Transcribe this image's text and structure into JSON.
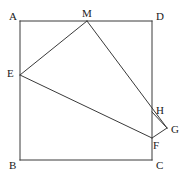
{
  "figure": {
    "kind": "plane-geometry-diagram",
    "width": 188,
    "height": 182,
    "background_color": "#ffffff",
    "stroke_color": "#3a3a3a",
    "label_color": "#1a1a1a",
    "stroke_width": 1
  },
  "vertices": {
    "A": {
      "label": "A",
      "x": 20,
      "y": 21,
      "label_x": 9,
      "label_y": 11,
      "on": "square-corner-top-left"
    },
    "D": {
      "label": "D",
      "x": 152,
      "y": 21,
      "label_x": 156,
      "label_y": 11,
      "on": "square-corner-top-right"
    },
    "B": {
      "label": "B",
      "x": 20,
      "y": 160,
      "label_x": 9,
      "label_y": 160,
      "on": "square-corner-bottom-left"
    },
    "C": {
      "label": "C",
      "x": 152,
      "y": 160,
      "label_x": 156,
      "label_y": 160,
      "on": "square-corner-bottom-right"
    },
    "M": {
      "label": "M",
      "x": 87,
      "y": 21,
      "label_x": 82,
      "label_y": 8,
      "on": "top-edge-AD"
    },
    "E": {
      "label": "E",
      "x": 20,
      "y": 75,
      "label_x": 7,
      "label_y": 68,
      "on": "left-edge-AB"
    },
    "H": {
      "label": "H",
      "x": 152,
      "y": 112,
      "label_x": 156,
      "label_y": 105,
      "on": "right-edge-DC"
    },
    "F": {
      "label": "F",
      "x": 152,
      "y": 138,
      "label_x": 153,
      "label_y": 140,
      "on": "right-edge-DC"
    },
    "G": {
      "label": "G",
      "x": 167,
      "y": 128,
      "label_x": 171,
      "label_y": 124,
      "on": "exterior-right"
    }
  },
  "square": {
    "name": "ABCD",
    "edges": [
      {
        "name": "edge-AD",
        "from": "A",
        "to": "D"
      },
      {
        "name": "edge-DC",
        "from": "D",
        "to": "C"
      },
      {
        "name": "edge-CB",
        "from": "C",
        "to": "B"
      },
      {
        "name": "edge-BA",
        "from": "B",
        "to": "A"
      }
    ]
  },
  "segments": [
    {
      "name": "segment-EM",
      "from": "E",
      "to": "M"
    },
    {
      "name": "segment-MG",
      "from": "M",
      "to": "G"
    },
    {
      "name": "segment-EF",
      "from": "E",
      "to": "F"
    },
    {
      "name": "segment-HG",
      "from": "H",
      "to": "G"
    },
    {
      "name": "segment-GF",
      "from": "G",
      "to": "F"
    }
  ],
  "labels_order": [
    "A",
    "M",
    "D",
    "E",
    "H",
    "G",
    "F",
    "B",
    "C"
  ]
}
